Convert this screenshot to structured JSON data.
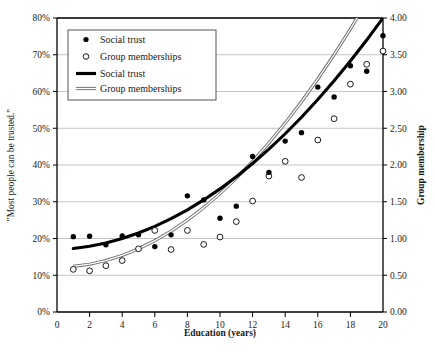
{
  "chart_data": {
    "type": "scatter",
    "title": "",
    "xlabel": "Education (years)",
    "ylabel": "\"Most people can be trusted.\"",
    "y2label": "Group membership",
    "xlim": [
      0,
      20
    ],
    "ylim": [
      0,
      80
    ],
    "y2lim": [
      0.0,
      4.0
    ],
    "grid": true,
    "legend_position": "top-left",
    "xticks": [
      0,
      2,
      4,
      6,
      8,
      10,
      12,
      14,
      16,
      18,
      20
    ],
    "xticklabels": [
      "0",
      "2",
      "4",
      "6",
      "8",
      "10",
      "12",
      "14",
      "16",
      "18",
      "20"
    ],
    "yticks": [
      0,
      10,
      20,
      30,
      40,
      50,
      60,
      70,
      80
    ],
    "yticklabels": [
      "0%",
      "10%",
      "20%",
      "30%",
      "40%",
      "50%",
      "60%",
      "70%",
      "80%"
    ],
    "y2ticks": [
      0.0,
      0.5,
      1.0,
      1.5,
      2.0,
      2.5,
      3.0,
      3.5,
      4.0
    ],
    "y2ticklabels": [
      "0.00",
      "0.50",
      "1.00",
      "1.50",
      "2.00",
      "2.50",
      "3.00",
      "3.50",
      "4.00"
    ],
    "legend": [
      {
        "label": "Social trust",
        "marker": "filled-circle",
        "type": "marker"
      },
      {
        "label": "Group memberships",
        "marker": "open-circle",
        "type": "marker"
      },
      {
        "label": "Social trust",
        "marker": "thick-line",
        "type": "line"
      },
      {
        "label": "Group memberships",
        "marker": "double-line",
        "type": "line"
      }
    ],
    "series": [
      {
        "name": "Social trust",
        "marker": "filled-circle",
        "axis": "left",
        "unit": "percent",
        "x": [
          1,
          2,
          3,
          4,
          5,
          6,
          7,
          8,
          9,
          10,
          11,
          12,
          13,
          14,
          15,
          16,
          17,
          18,
          19,
          20
        ],
        "values": [
          20.5,
          20.6,
          18.3,
          20.7,
          21.0,
          17.8,
          21.0,
          31.6,
          30.5,
          25.5,
          28.8,
          42.3,
          38.0,
          46.5,
          48.8,
          61.2,
          58.5,
          67.0,
          65.5,
          75.2
        ]
      },
      {
        "name": "Group memberships",
        "marker": "open-circle",
        "axis": "right",
        "unit": "count",
        "x": [
          1,
          2,
          3,
          4,
          5,
          6,
          7,
          8,
          9,
          10,
          11,
          12,
          13,
          14,
          15,
          16,
          17,
          18,
          19,
          20
        ],
        "values": [
          0.58,
          0.56,
          0.63,
          0.7,
          0.86,
          1.11,
          0.85,
          1.11,
          0.92,
          1.02,
          1.23,
          1.51,
          1.85,
          2.05,
          1.83,
          2.34,
          2.63,
          3.1,
          3.37,
          3.55
        ]
      },
      {
        "name": "Social trust",
        "type": "fit-curve",
        "style": "thick-line",
        "axis": "left",
        "unit": "percent",
        "x": [
          1,
          2,
          3,
          4,
          5,
          6,
          7,
          8,
          9,
          10,
          11,
          12,
          13,
          14,
          15,
          16,
          17,
          18,
          19,
          20
        ],
        "values": [
          17.3,
          17.9,
          18.8,
          20.0,
          21.5,
          23.3,
          25.4,
          27.8,
          30.5,
          33.5,
          36.8,
          40.4,
          44.3,
          48.5,
          53.0,
          57.8,
          62.9,
          68.3,
          74.0,
          80.0
        ]
      },
      {
        "name": "Group memberships",
        "type": "fit-curve",
        "style": "double-line",
        "axis": "right",
        "unit": "count",
        "x": [
          1,
          2,
          3,
          4,
          5,
          6,
          7,
          8,
          9,
          10,
          11,
          12,
          13,
          14,
          15,
          16,
          17,
          18,
          19,
          20
        ],
        "values": [
          0.62,
          0.65,
          0.7,
          0.77,
          0.86,
          0.97,
          1.1,
          1.25,
          1.42,
          1.61,
          1.82,
          2.05,
          2.3,
          2.57,
          2.86,
          3.17,
          3.5,
          3.85,
          4.22,
          4.61
        ]
      }
    ]
  }
}
